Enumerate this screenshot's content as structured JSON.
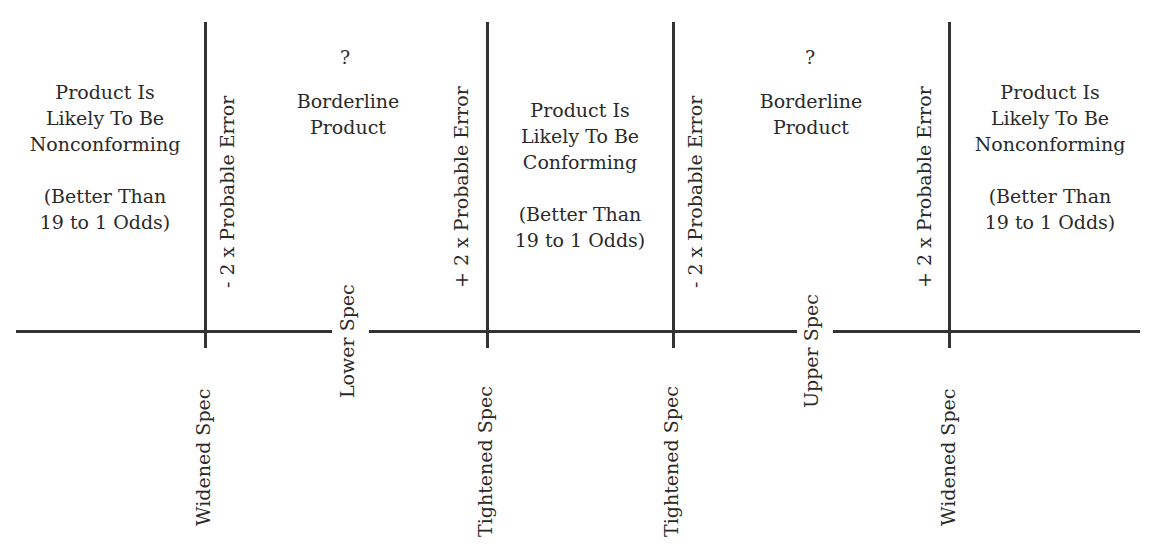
{
  "diagram": {
    "zones": [
      {
        "id": "left-nonconforming",
        "lines": [
          "Product Is",
          "Likely To Be",
          "Nonconforming"
        ],
        "odds": [
          "(Better Than",
          "19 to 1 Odds)"
        ]
      },
      {
        "id": "left-borderline",
        "marker": "?",
        "lines": [
          "Borderline",
          "Product"
        ]
      },
      {
        "id": "center-conforming",
        "lines": [
          "Product Is",
          "Likely To Be",
          "Conforming"
        ],
        "odds": [
          "(Better Than",
          "19 to 1 Odds)"
        ]
      },
      {
        "id": "right-borderline",
        "marker": "?",
        "lines": [
          "Borderline",
          "Product"
        ]
      },
      {
        "id": "right-nonconforming",
        "lines": [
          "Product Is",
          "Likely To Be",
          "Nonconforming"
        ],
        "odds": [
          "(Better Than",
          "19 to 1 Odds)"
        ]
      }
    ],
    "vertical_line_labels": [
      "- 2 x Probable Error",
      "+ 2 x Probable Error",
      "- 2 x Probable Error",
      "+ 2 x Probable Error"
    ],
    "axis_labels": {
      "widened_left": "Widened Spec",
      "lower": "Lower Spec",
      "tightened_left": "Tightened Spec",
      "tightened_right": "Tightened Spec",
      "upper": "Upper Spec",
      "widened_right": "Widened Spec"
    },
    "colors": {
      "line": "#333333",
      "text": "#2a2a2a",
      "background": "#ffffff"
    }
  }
}
